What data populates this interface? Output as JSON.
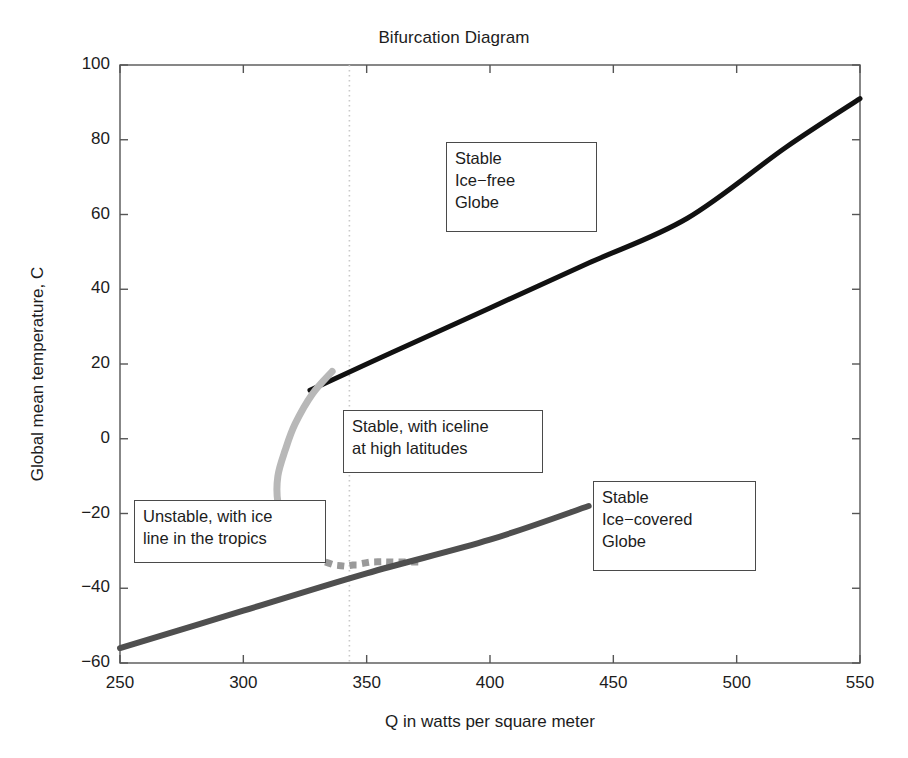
{
  "chart_data": {
    "type": "line",
    "title": "Bifurcation Diagram",
    "xlabel": "Q in watts per square meter",
    "ylabel": "Global mean temperature, C",
    "xlim": [
      250,
      550
    ],
    "ylim": [
      -60,
      100
    ],
    "xticks": [
      "250",
      "300",
      "350",
      "400",
      "450",
      "500",
      "550"
    ],
    "yticks": [
      "100",
      "80",
      "60",
      "40",
      "20",
      "0",
      "-20",
      "-40",
      "-60"
    ],
    "grid": false,
    "legend": "none",
    "colors": {
      "stable_ice_free": "#111111",
      "stable_iceline": "#b8b8b8",
      "unstable": "#9a9a9a",
      "stable_ice_covered": "#4f4f4f",
      "reference_line": "#c9c9c9",
      "axis": "#555555"
    },
    "series": [
      {
        "name": "Stable ice-free globe branch",
        "style": "solid",
        "color": "#111111",
        "linewidth": 5,
        "points": [
          [
            327,
            13
          ],
          [
            360,
            23
          ],
          [
            400,
            35
          ],
          [
            440,
            47
          ],
          [
            480,
            59
          ],
          [
            520,
            78
          ],
          [
            550,
            91
          ]
        ]
      },
      {
        "name": "Stable branch with iceline at high latitudes",
        "style": "solid",
        "color": "#b8b8b8",
        "linewidth": 7,
        "points": [
          [
            336,
            18
          ],
          [
            328,
            12
          ],
          [
            321,
            4
          ],
          [
            317,
            -3
          ],
          [
            314,
            -10
          ],
          [
            314,
            -17
          ],
          [
            317,
            -23
          ],
          [
            322,
            -28
          ]
        ]
      },
      {
        "name": "Unstable branch with ice line in the tropics",
        "style": "dotted",
        "color": "#9a9a9a",
        "linewidth": 7,
        "points": [
          [
            322,
            -28
          ],
          [
            330,
            -32
          ],
          [
            340,
            -34
          ],
          [
            352,
            -33
          ],
          [
            362,
            -33
          ],
          [
            373,
            -33
          ]
        ]
      },
      {
        "name": "Stable ice-covered globe branch",
        "style": "solid",
        "color": "#4f4f4f",
        "linewidth": 6,
        "points": [
          [
            250,
            -56
          ],
          [
            300,
            -46
          ],
          [
            350,
            -36
          ],
          [
            400,
            -27
          ],
          [
            440,
            -18
          ]
        ]
      }
    ],
    "reference_lines": [
      {
        "name": "bifurcation-threshold",
        "orientation": "vertical",
        "x": 343,
        "style": "dotted",
        "color": "#c9c9c9"
      }
    ],
    "annotations": [
      {
        "id": "stable-ice-free",
        "text": "Stable\nIce−free\nGlobe",
        "x": 446,
        "y": 142,
        "w": 151,
        "h": 90
      },
      {
        "id": "stable-iceline",
        "text": "Stable, with iceline\nat high latitudes",
        "x": 343,
        "y": 410,
        "w": 200,
        "h": 63
      },
      {
        "id": "unstable-tropics",
        "text": "Unstable, with ice\nline in the tropics",
        "x": 134,
        "y": 500,
        "w": 192,
        "h": 63
      },
      {
        "id": "stable-ice-covered",
        "text": "Stable\nIce−covered\nGlobe",
        "x": 593,
        "y": 481,
        "w": 163,
        "h": 90
      }
    ]
  }
}
